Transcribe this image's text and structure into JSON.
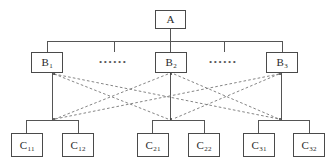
{
  "diagram": {
    "type": "tree-hierarchy",
    "levels": 3,
    "colors": {
      "node_border": "#4a4a4a",
      "node_fill": "#ffffff",
      "solid_edge": "#555555",
      "dashed_edge": "#777777",
      "text": "#2b2b2b",
      "background": "#ffffff"
    },
    "nodes": {
      "root": {
        "id": "A",
        "base": "A",
        "sub": ""
      },
      "level2": [
        {
          "id": "B1",
          "base": "B",
          "sub": "1"
        },
        {
          "id": "B2",
          "base": "B",
          "sub": "2"
        },
        {
          "id": "B3",
          "base": "B",
          "sub": "3"
        }
      ],
      "level3": [
        {
          "id": "C11",
          "base": "C",
          "sub": "11"
        },
        {
          "id": "C12",
          "base": "C",
          "sub": "12"
        },
        {
          "id": "C21",
          "base": "C",
          "sub": "21"
        },
        {
          "id": "C22",
          "base": "C",
          "sub": "22"
        },
        {
          "id": "C31",
          "base": "C",
          "sub": "31"
        },
        {
          "id": "C32",
          "base": "C",
          "sub": "32"
        }
      ]
    },
    "ellipses": [
      {
        "id": "ellipsis-left",
        "text": "••••••"
      },
      {
        "id": "ellipsis-right",
        "text": "••••••"
      }
    ],
    "edges": {
      "solid": [
        {
          "from": "A",
          "to": "bus-level2"
        },
        {
          "from": "bus-level2",
          "to": "B1"
        },
        {
          "from": "bus-level2",
          "to": "B2"
        },
        {
          "from": "bus-level2",
          "to": "B3"
        },
        {
          "from": "B1",
          "to": "bus-group1"
        },
        {
          "from": "B2",
          "to": "bus-group2"
        },
        {
          "from": "B3",
          "to": "bus-group3"
        },
        {
          "from": "bus-group1",
          "to": "C11"
        },
        {
          "from": "bus-group1",
          "to": "C12"
        },
        {
          "from": "bus-group2",
          "to": "C21"
        },
        {
          "from": "bus-group2",
          "to": "C22"
        },
        {
          "from": "bus-group3",
          "to": "C31"
        },
        {
          "from": "bus-group3",
          "to": "C32"
        }
      ],
      "dashed": [
        {
          "from": "B1",
          "to": "group2"
        },
        {
          "from": "B1",
          "to": "group3"
        },
        {
          "from": "B2",
          "to": "group1"
        },
        {
          "from": "B2",
          "to": "group3"
        },
        {
          "from": "B3",
          "to": "group1"
        },
        {
          "from": "B3",
          "to": "group2"
        }
      ]
    }
  }
}
